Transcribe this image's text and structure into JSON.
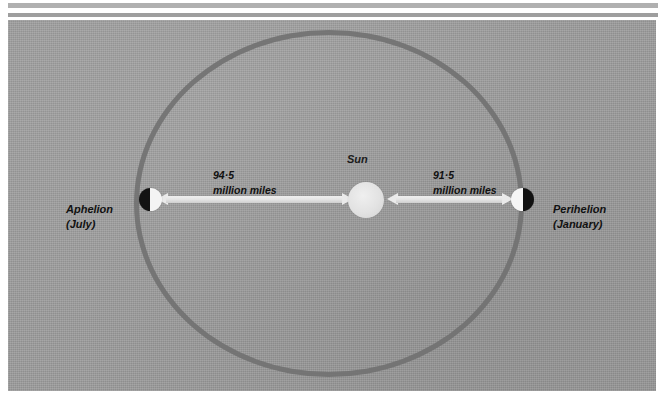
{
  "figure": {
    "title_semantic": "earth-orbit-around-sun-diagram",
    "background_color": "#9d9d9d",
    "orbit_color": "#6f6f6f",
    "sun_color": "#e6e6e6",
    "arrow_color": "#eaeaea",
    "text_color": "#111111"
  },
  "sun": {
    "label": "Sun"
  },
  "aphelion": {
    "name": "Aphelion",
    "month": "(July)",
    "distance_value": "94·5",
    "distance_unit": "million miles"
  },
  "perihelion": {
    "name": "Perihelion",
    "month": "(January)",
    "distance_value": "91·5",
    "distance_unit": "million miles"
  },
  "chart_data": {
    "type": "diagram",
    "points": [
      {
        "name": "Aphelion",
        "month": "July",
        "distance": 94.5,
        "unit": "million miles",
        "side": "left"
      },
      {
        "name": "Perihelion",
        "month": "January",
        "distance": 91.5,
        "unit": "million miles",
        "side": "right"
      },
      {
        "name": "Sun",
        "position": "focus",
        "side": "center"
      }
    ]
  }
}
